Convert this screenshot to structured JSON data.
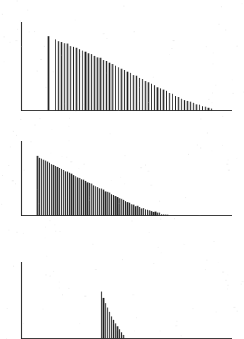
{
  "figure": {
    "title": "",
    "background_color": "#ffffff",
    "ink_color": "#1d1d1d",
    "width": 244,
    "height": 339
  },
  "chart_data": [
    {
      "type": "bar",
      "name": "panel-1",
      "title": "",
      "xlabel": "",
      "ylabel": "",
      "grid": false,
      "legend": null,
      "axis": {
        "y_axis_x": 21,
        "y_axis_top": 22,
        "baseline_y": 111,
        "baseline_x_start": 21,
        "baseline_x_end": 232
      },
      "xlim": [
        21,
        232
      ],
      "ylim": [
        0,
        89
      ],
      "note": "Isolated tall line at x=48, gap, then dense comb from x=55 decaying near-linearly to x=210",
      "x": [
        48,
        55,
        58,
        61,
        64,
        67,
        70,
        73,
        76,
        79,
        82,
        85,
        88,
        91,
        94,
        97,
        100,
        103,
        106,
        109,
        112,
        115,
        118,
        121,
        124,
        127,
        130,
        133,
        136,
        139,
        142,
        145,
        148,
        151,
        154,
        157,
        160,
        163,
        166,
        169,
        172,
        175,
        178,
        181,
        184,
        187,
        190,
        193,
        196,
        199,
        202,
        205,
        208,
        211
      ],
      "values": [
        75,
        72,
        70,
        69,
        68,
        67,
        65,
        64,
        63,
        62,
        60,
        59,
        58,
        57,
        55,
        54,
        53,
        51,
        50,
        48,
        47,
        45,
        44,
        42,
        41,
        39,
        38,
        36,
        35,
        33,
        32,
        30,
        29,
        27,
        26,
        24,
        23,
        21,
        20,
        18,
        17,
        15,
        14,
        12,
        11,
        10,
        9,
        8,
        7,
        6,
        5,
        4,
        3,
        2
      ]
    },
    {
      "type": "bar",
      "name": "panel-2",
      "title": "",
      "xlabel": "",
      "ylabel": "",
      "grid": false,
      "legend": null,
      "axis": {
        "y_axis_x": 21,
        "y_axis_top": 141,
        "baseline_y": 216,
        "baseline_x_start": 21,
        "baseline_x_end": 232
      },
      "xlim": [
        21,
        232
      ],
      "ylim": [
        0,
        75
      ],
      "note": "Dense comb starting abruptly at x=37, convex decay reaching baseline near x=168",
      "x": [
        37,
        39,
        41,
        43,
        45,
        47,
        49,
        51,
        53,
        55,
        57,
        59,
        61,
        63,
        65,
        67,
        69,
        71,
        73,
        75,
        77,
        79,
        81,
        83,
        85,
        87,
        89,
        91,
        93,
        95,
        97,
        99,
        101,
        103,
        105,
        107,
        109,
        111,
        113,
        115,
        117,
        119,
        121,
        123,
        125,
        127,
        129,
        131,
        133,
        135,
        137,
        139,
        141,
        143,
        145,
        147,
        149,
        151,
        153,
        155,
        157,
        159,
        161,
        163,
        165,
        167
      ],
      "values": [
        60,
        58,
        57,
        56,
        55,
        54,
        53,
        52,
        51,
        50,
        49,
        48,
        47,
        46,
        45,
        44,
        43,
        42,
        41,
        40,
        39,
        38,
        37,
        36,
        35,
        34,
        33,
        32,
        31,
        30,
        29,
        28,
        27,
        26,
        25,
        24,
        23,
        22,
        21,
        20,
        19,
        18,
        17,
        16,
        15,
        14,
        13,
        12,
        11,
        10,
        10,
        9,
        8,
        8,
        7,
        6,
        6,
        5,
        4,
        4,
        3,
        3,
        2,
        2,
        1,
        1
      ]
    },
    {
      "type": "bar",
      "name": "panel-3",
      "title": "",
      "xlabel": "",
      "ylabel": "",
      "grid": false,
      "legend": null,
      "axis": {
        "y_axis_x": 21,
        "y_axis_top": 262,
        "baseline_y": 339,
        "baseline_x_start": 21,
        "baseline_x_end": 232
      },
      "xlim": [
        21,
        232
      ],
      "ylim": [
        0,
        77
      ],
      "note": "Narrow triangular cluster only, x=101 to x=123, sharp rapid decay; panel bottom cropped by image edge",
      "x": [
        101,
        103,
        105,
        107,
        109,
        111,
        113,
        115,
        117,
        119,
        121,
        123
      ],
      "values": [
        47,
        41,
        36,
        31,
        27,
        23,
        19,
        16,
        13,
        10,
        7,
        4
      ]
    }
  ]
}
